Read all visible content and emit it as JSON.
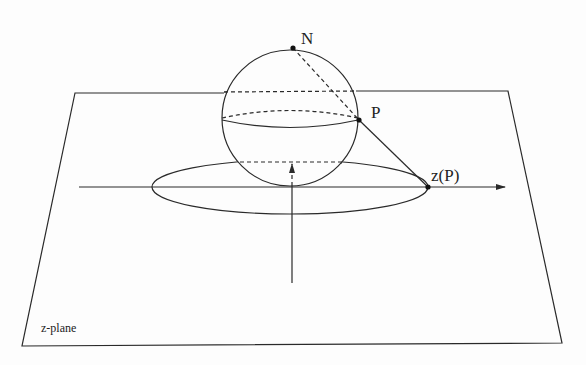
{
  "figure": {
    "colors": {
      "stroke": "#2a2a2a",
      "background": "#fdfdfd"
    }
  },
  "labels": {
    "north_pole": "N",
    "point_p": "P",
    "projection": "z(P)",
    "plane": "z-plane"
  },
  "geometry": {
    "plane_corners": [
      [
        75,
        93
      ],
      [
        508,
        91
      ],
      [
        562,
        343
      ],
      [
        22,
        346
      ]
    ],
    "sphere": {
      "cx": 290,
      "cy": 118,
      "r": 68
    },
    "north_pole": [
      293,
      48
    ],
    "point_p": [
      359,
      120
    ],
    "projection_point": [
      428,
      187
    ],
    "unit_circle_ellipse": {
      "cx": 290,
      "cy": 187,
      "rx": 138,
      "ry": 27
    }
  }
}
